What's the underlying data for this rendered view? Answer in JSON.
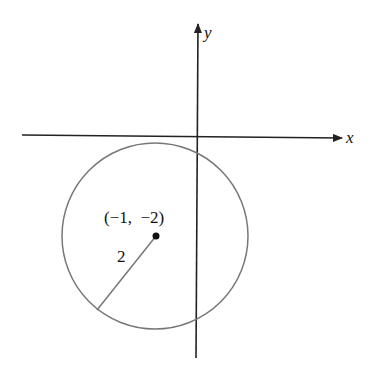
{
  "diagram": {
    "type": "circle-on-coordinate-plane",
    "axes": {
      "x_label": "x",
      "y_label": "y"
    },
    "circle": {
      "center_label": "(−1,  −2)",
      "center": [
        -1,
        -2
      ],
      "radius_label": "2",
      "radius": 2
    },
    "colors": {
      "axis": "#222222",
      "circle": "#777777",
      "point": "#111111"
    }
  }
}
